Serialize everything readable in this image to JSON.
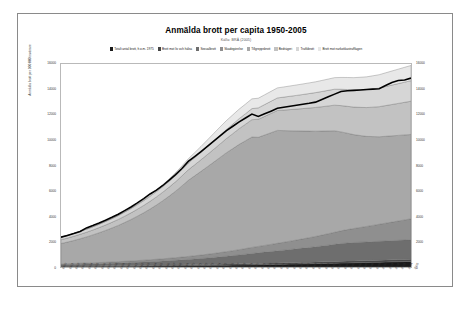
{
  "figure": {
    "title": "Anmälda brott per capita 1950-2005",
    "subtitle": "Källa: BRÅ (2005)",
    "axis_title_y": "Anmälda brott per 100 000 invånare"
  },
  "chart_data": {
    "type": "area",
    "stacked": true,
    "title": "Anmälda brott per capita 1950-2005",
    "subtitle": "Källa: BRÅ (2005)",
    "xlabel": "",
    "ylabel": "Anmälda brott per 100 000 invånare",
    "ylim": [
      0,
      16000
    ],
    "yticks": [
      0,
      2000,
      4000,
      6000,
      8000,
      10000,
      12000,
      14000,
      16000
    ],
    "ytick_labels_left": [
      "0",
      "2000",
      "4000",
      "6000",
      "8000",
      "10000",
      "12000",
      "14000",
      "16000"
    ],
    "ytick_labels_right": [
      "0",
      "2000",
      "4000",
      "6000",
      "8000",
      "10000",
      "12000",
      "14000",
      "16000"
    ],
    "grid": false,
    "legend_position": "top",
    "dual_axis": true,
    "x": [
      1950,
      1951,
      1952,
      1953,
      1954,
      1955,
      1956,
      1957,
      1958,
      1959,
      1960,
      1961,
      1962,
      1963,
      1964,
      1965,
      1966,
      1967,
      1968,
      1969,
      1970,
      1971,
      1972,
      1973,
      1974,
      1975,
      1976,
      1977,
      1978,
      1979,
      1980,
      1981,
      1982,
      1983,
      1984,
      1985,
      1986,
      1987,
      1988,
      1989,
      1990,
      1991,
      1992,
      1993,
      1994,
      1995,
      1996,
      1997,
      1998,
      1999,
      2000,
      2001,
      2002,
      2003,
      2004,
      2005
    ],
    "categories": [
      1950,
      1951,
      1952,
      1953,
      1954,
      1955,
      1956,
      1957,
      1958,
      1959,
      1960,
      1961,
      1962,
      1963,
      1964,
      1965,
      1966,
      1967,
      1968,
      1969,
      1970,
      1971,
      1972,
      1973,
      1974,
      1975,
      1976,
      1977,
      1978,
      1979,
      1980,
      1981,
      1982,
      1983,
      1984,
      1985,
      1986,
      1987,
      1988,
      1989,
      1990,
      1991,
      1992,
      1993,
      1994,
      1995,
      1996,
      1997,
      1998,
      1999,
      2000,
      2001,
      2002,
      2003,
      2004,
      2005
    ],
    "series": [
      {
        "name": "Brott mot liv och hälsa",
        "color": "#1a1a1a",
        "values": [
          40,
          42,
          43,
          45,
          46,
          48,
          50,
          52,
          54,
          57,
          60,
          63,
          66,
          70,
          74,
          78,
          83,
          88,
          93,
          98,
          104,
          110,
          116,
          122,
          129,
          136,
          143,
          150,
          158,
          166,
          175,
          183,
          192,
          201,
          210,
          219,
          229,
          239,
          249,
          259,
          270,
          281,
          292,
          303,
          314,
          325,
          336,
          347,
          358,
          369,
          380,
          392,
          404,
          416,
          428,
          440
        ]
      },
      {
        "name": "Sexualbrott",
        "color": "#454545",
        "values": [
          30,
          31,
          32,
          33,
          34,
          36,
          37,
          39,
          40,
          42,
          44,
          46,
          48,
          50,
          52,
          54,
          57,
          59,
          62,
          64,
          67,
          70,
          72,
          75,
          78,
          81,
          84,
          87,
          90,
          93,
          96,
          99,
          102,
          105,
          108,
          111,
          114,
          117,
          120,
          123,
          126,
          129,
          132,
          135,
          138,
          141,
          144,
          147,
          150,
          153,
          156,
          160,
          164,
          168,
          172,
          176
        ]
      },
      {
        "name": "Rån och grov stöld",
        "color": "#6e6e6e",
        "values": [
          120,
          128,
          136,
          145,
          154,
          164,
          175,
          186,
          198,
          211,
          225,
          240,
          256,
          273,
          291,
          310,
          330,
          352,
          375,
          400,
          426,
          454,
          484,
          516,
          550,
          586,
          624,
          664,
          707,
          752,
          800,
          840,
          880,
          920,
          960,
          1000,
          1040,
          1080,
          1120,
          1160,
          1200,
          1250,
          1300,
          1350,
          1400,
          1430,
          1450,
          1460,
          1470,
          1480,
          1490,
          1500,
          1510,
          1520,
          1530,
          1540
        ]
      },
      {
        "name": "Skadegörelse",
        "color": "#8f8f8f",
        "values": [
          60,
          64,
          68,
          73,
          78,
          83,
          89,
          95,
          102,
          109,
          117,
          125,
          134,
          144,
          154,
          165,
          177,
          190,
          204,
          219,
          235,
          252,
          270,
          290,
          311,
          334,
          358,
          384,
          412,
          442,
          474,
          500,
          528,
          557,
          588,
          620,
          654,
          690,
          728,
          768,
          810,
          854,
          900,
          948,
          998,
          1050,
          1104,
          1160,
          1218,
          1278,
          1340,
          1400,
          1460,
          1520,
          1580,
          1640
        ]
      },
      {
        "name": "Tillgreppsbrott",
        "color": "#a8a8a8",
        "values": [
          1600,
          1700,
          1810,
          1930,
          2060,
          2200,
          2350,
          2510,
          2680,
          2860,
          3060,
          3270,
          3500,
          3740,
          4000,
          4280,
          4580,
          4900,
          5240,
          5610,
          6000,
          6300,
          6600,
          6900,
          7200,
          7500,
          7800,
          8050,
          8300,
          8500,
          8700,
          8600,
          8700,
          8800,
          8900,
          8800,
          8700,
          8600,
          8500,
          8400,
          8300,
          8200,
          8100,
          8000,
          7800,
          7600,
          7400,
          7250,
          7100,
          7000,
          6900,
          6850,
          6800,
          6750,
          6700,
          6650
        ]
      },
      {
        "name": "Bedrägeri",
        "color": "#c2c2c2",
        "values": [
          300,
          315,
          331,
          348,
          366,
          385,
          405,
          426,
          448,
          471,
          496,
          522,
          549,
          577,
          607,
          639,
          672,
          707,
          744,
          783,
          824,
          867,
          912,
          960,
          1010,
          1063,
          1118,
          1176,
          1237,
          1301,
          1368,
          1420,
          1470,
          1520,
          1570,
          1620,
          1670,
          1720,
          1770,
          1820,
          1870,
          1920,
          1970,
          2020,
          2070,
          2120,
          2170,
          2220,
          2270,
          2320,
          2370,
          2420,
          2470,
          2520,
          2570,
          2620
        ]
      },
      {
        "name": "Trafikbrott",
        "color": "#d6d6d6",
        "values": [
          200,
          210,
          221,
          232,
          244,
          256,
          269,
          283,
          297,
          312,
          328,
          344,
          362,
          380,
          399,
          419,
          440,
          462,
          485,
          509,
          535,
          561,
          589,
          619,
          650,
          682,
          716,
          752,
          790,
          829,
          870,
          900,
          930,
          960,
          990,
          1020,
          1050,
          1080,
          1110,
          1140,
          1170,
          1200,
          1230,
          1260,
          1290,
          1320,
          1350,
          1380,
          1410,
          1440,
          1470,
          1500,
          1530,
          1560,
          1590,
          1620
        ]
      },
      {
        "name": "Brott mot narkotikastrafflagen",
        "color": "#e8e8e8",
        "values": [
          0,
          0,
          0,
          0,
          0,
          0,
          0,
          0,
          0,
          0,
          10,
          20,
          35,
          55,
          80,
          110,
          145,
          185,
          230,
          280,
          335,
          395,
          460,
          530,
          600,
          660,
          700,
          730,
          750,
          760,
          770,
          760,
          770,
          780,
          790,
          800,
          810,
          820,
          830,
          840,
          850,
          870,
          890,
          910,
          930,
          950,
          970,
          990,
          1010,
          1030,
          1050,
          1080,
          1110,
          1140,
          1170,
          1200
        ]
      }
    ],
    "total_line": {
      "name": "Totalt antal anmälda brott per 100 000 invånare",
      "color": "#000000",
      "values": [
        2350,
        2490,
        2641,
        2806,
        3082,
        3272,
        3475,
        3691,
        3919,
        4161,
        4440,
        4730,
        5050,
        5392,
        5757,
        6055,
        6424,
        6843,
        7283,
        7763,
        8326,
        8709,
        9103,
        9512,
        9928,
        10342,
        10743,
        11093,
        11444,
        11743,
        12053,
        11862,
        12072,
        12283,
        12506,
        12590,
        12667,
        12746,
        12827,
        12904,
        12996,
        13204,
        13414,
        13626,
        13840,
        13896,
        13924,
        13954,
        13986,
        14020,
        14056,
        14302,
        14548,
        14694,
        14740,
        14886
      ]
    }
  },
  "legend": [
    {
      "label": "Totalt antal brott, fr.o.m. 1975",
      "color": "#1a1a1a"
    },
    {
      "label": "Brott mot liv och hälsa",
      "color": "#454545"
    },
    {
      "label": "Sexualbrott",
      "color": "#6e6e6e"
    },
    {
      "label": "Skadegörelse",
      "color": "#8f8f8f"
    },
    {
      "label": "Tillgreppsbrott",
      "color": "#a8a8a8"
    },
    {
      "label": "Bedrägeri",
      "color": "#c2c2c2"
    },
    {
      "label": "Trafikbrott",
      "color": "#d6d6d6"
    },
    {
      "label": "Brott mot narkotikastrafflagen",
      "color": "#e8e8e8"
    }
  ]
}
